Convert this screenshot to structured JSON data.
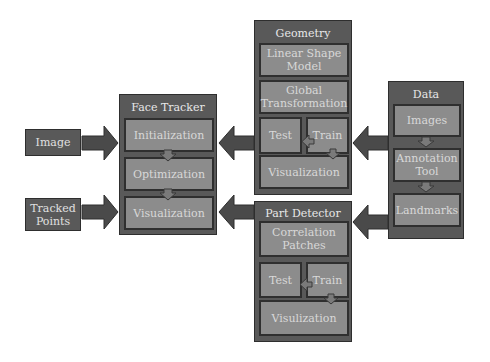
{
  "diagram": {
    "inputs": {
      "image": "Image",
      "tracked_points": "Tracked Points"
    },
    "face_tracker": {
      "title": "Face Tracker",
      "steps": [
        "Initialization",
        "Optimization",
        "Visualization"
      ]
    },
    "geometry": {
      "title": "Geometry",
      "linear_shape_model": "Linear Shape Model",
      "global_transformation": "Global Transformation",
      "test": "Test",
      "train": "Train",
      "visualization": "Visualization"
    },
    "part_detector": {
      "title": "Part Detector",
      "correlation_patches": "Correlation Patches",
      "test": "Test",
      "train": "Train",
      "visualization": "Visulization"
    },
    "data": {
      "title": "Data",
      "steps": [
        "Images",
        "Annotation Tool",
        "Landmarks"
      ]
    },
    "colors": {
      "outer_box": "#595959",
      "inner_box": "#8c8c8c",
      "arrow": "#4a4a4a",
      "small_arrow": "#7a7a7a",
      "text": "#e0e0e0"
    }
  }
}
